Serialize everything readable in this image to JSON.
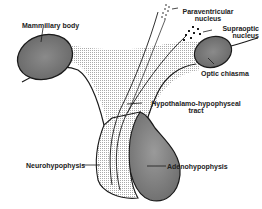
{
  "labels": {
    "mammillary_body": "Mammillary body",
    "paraventricular_1": "Paraventricular",
    "paraventricular_2": "nucleus",
    "supraoptic_1": "Supraoptic",
    "supraoptic_2": "nucleus",
    "optic_chiasma": "Optic chiasma",
    "tract_1": "Hypothalamo-hypophyseal",
    "tract_2": "tract",
    "neurohypophysis": "Neurohypophysis",
    "adenohypophysis": "Adenohypophysis"
  },
  "colors": {
    "outline": "#1a1a1a",
    "stipple": "#c8c8c8",
    "dark_body": "#7a7a7a",
    "adeno": "#8c8c8c"
  }
}
